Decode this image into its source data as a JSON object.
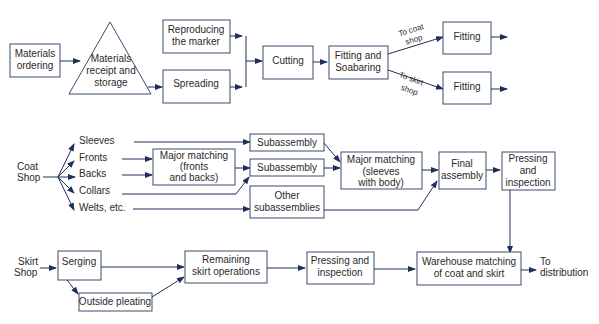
{
  "diagram": {
    "colors": {
      "stroke": "#3c4a6e",
      "arrow": "#1f2f5a",
      "text": "#2a2a2a",
      "background": "#ffffff"
    },
    "top_flow": {
      "materials_ordering": [
        "Materials",
        "ordering"
      ],
      "receipt_storage": [
        "Materials",
        "receipt and",
        "storage"
      ],
      "reproducing_marker": [
        "Reproducing",
        "the marker"
      ],
      "spreading": "Spreading",
      "cutting": "Cutting",
      "fitting_soabaring": [
        "Fitting and",
        "Soabaring"
      ],
      "to_coat_shop": [
        "To coat",
        "shop"
      ],
      "to_skirt_shop": [
        "To skirt",
        "shop"
      ],
      "fitting_coat": "Fitting",
      "fitting_skirt": "Fitting"
    },
    "coat_shop": {
      "label": [
        "Coat",
        "Shop"
      ],
      "parts": [
        "Sleeves",
        "Fronts",
        "Backs",
        "Collars",
        "Welts, etc."
      ],
      "major_matching_fb": [
        "Major matching",
        "(fronts",
        "and backs)"
      ],
      "subassembly_1": "Subassembly",
      "subassembly_2": "Subassembly",
      "other_subassemblies": [
        "Other",
        "subassemblies"
      ],
      "major_matching_sb": [
        "Major matching",
        "(sleeves",
        "with body)"
      ],
      "final_assembly": [
        "Final",
        "assembly"
      ],
      "pressing_inspection": [
        "Pressing",
        "and",
        "inspection"
      ]
    },
    "skirt_shop": {
      "label": [
        "Skirt",
        "Shop"
      ],
      "serging": "Serging",
      "outside_pleating": "Outside pleating",
      "remaining_ops": [
        "Remaining",
        "skirt operations"
      ],
      "pressing_inspection": [
        "Pressing and",
        "inspection"
      ],
      "warehouse": [
        "Warehouse matching",
        "of coat and skirt"
      ],
      "to_distribution": [
        "To",
        "distribution"
      ]
    }
  }
}
